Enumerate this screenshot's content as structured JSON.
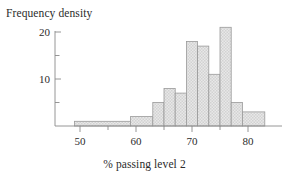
{
  "figure": {
    "title": "",
    "y_axis_label": "Frequency density",
    "x_axis_label": "% passing level 2"
  },
  "axes": {
    "y_ticks_major": [
      "10",
      "20"
    ],
    "y_tick_values": [
      10,
      20
    ],
    "y_ticks_minor": [
      5,
      15
    ],
    "x_ticks_major": [
      "50",
      "60",
      "70",
      "80"
    ],
    "x_tick_values": [
      50,
      60,
      70,
      80
    ],
    "x_ticks_minor": [
      55,
      65,
      75
    ],
    "axis_color": "#8a8a8a"
  },
  "style": {
    "bar_fill": "#e3e3e3",
    "bar_edge": "#9a9a9a",
    "background": "#ffffff",
    "text_color": "#2b2b2b"
  },
  "chart_data": {
    "type": "bar",
    "title": "",
    "xlabel": "% passing level 2",
    "ylabel": "Frequency density",
    "xlim": [
      46,
      86
    ],
    "ylim": [
      0,
      22
    ],
    "grid": false,
    "legend": null,
    "bin_edges": [
      49,
      59,
      63,
      65,
      67,
      69,
      71,
      73,
      75,
      77,
      79,
      83
    ],
    "categories": [
      "49-59",
      "59-63",
      "63-65",
      "65-67",
      "67-69",
      "69-71",
      "71-73",
      "73-75",
      "75-77",
      "77-79",
      "79-83"
    ],
    "values": [
      1,
      2,
      5,
      8,
      7,
      18,
      17,
      11,
      21,
      5,
      3
    ],
    "bars": [
      {
        "x0": 49,
        "x1": 59,
        "height": 1
      },
      {
        "x0": 59,
        "x1": 63,
        "height": 2
      },
      {
        "x0": 63,
        "x1": 65,
        "height": 5
      },
      {
        "x0": 65,
        "x1": 67,
        "height": 8
      },
      {
        "x0": 67,
        "x1": 69,
        "height": 7
      },
      {
        "x0": 69,
        "x1": 71,
        "height": 18
      },
      {
        "x0": 71,
        "x1": 73,
        "height": 17
      },
      {
        "x0": 73,
        "x1": 75,
        "height": 11
      },
      {
        "x0": 75,
        "x1": 77,
        "height": 21
      },
      {
        "x0": 77,
        "x1": 79,
        "height": 5
      },
      {
        "x0": 79,
        "x1": 83,
        "height": 3
      }
    ]
  }
}
